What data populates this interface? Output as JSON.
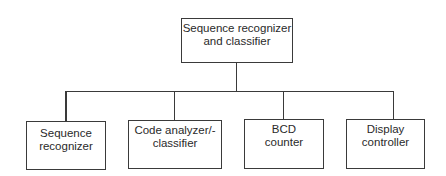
{
  "diagram": {
    "type": "hierarchy",
    "root": {
      "label": "Sequence recognizer\nand classifier",
      "line1": "Sequence recognizer",
      "line2": "and classifier"
    },
    "children": [
      {
        "line1": "Sequence",
        "line2": "recognizer"
      },
      {
        "line1": "Code analyzer/-",
        "line2": "classifier"
      },
      {
        "line1": "BCD",
        "line2": "counter"
      },
      {
        "line1": "Display",
        "line2": "controller"
      }
    ],
    "colors": {
      "stroke": "#3a3a3a",
      "text": "#2a2a2a",
      "background": "#ffffff"
    }
  }
}
